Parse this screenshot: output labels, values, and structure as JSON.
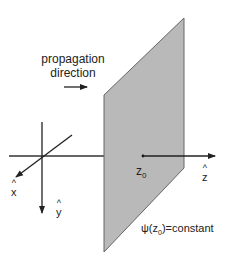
{
  "diagram": {
    "title_line1": "propagation",
    "title_line2": "direction",
    "axes": {
      "x": {
        "letter": "x",
        "hat": "^"
      },
      "y": {
        "letter": "y",
        "hat": "^"
      },
      "z": {
        "letter": "z",
        "hat": "^"
      }
    },
    "z0_label": "z",
    "z0_sub": "0",
    "wavefront_label_pre": "ψ(z",
    "wavefront_label_sub": "0",
    "wavefront_label_post": ")=constant",
    "colors": {
      "plane_fill": "#b9b9b9",
      "plane_edge": "#555555",
      "line": "#222222"
    }
  }
}
